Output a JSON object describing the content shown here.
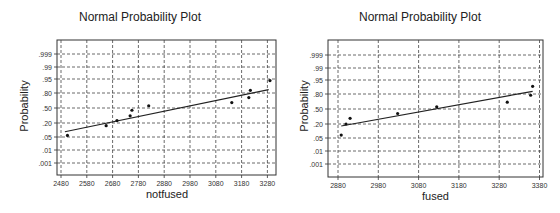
{
  "chart_data": [
    {
      "type": "scatter",
      "title": "Normal Probability Plot",
      "xlabel": "notfused",
      "ylabel": "Probability",
      "x_ticks": [
        2480,
        2580,
        2680,
        2780,
        2880,
        2980,
        3080,
        3180,
        3280
      ],
      "y_ticks": [
        ".001",
        ".01",
        ".05",
        ".20",
        ".50",
        ".80",
        ".95",
        ".99",
        ".999"
      ],
      "xlim": [
        2465,
        3310
      ],
      "grid": true,
      "points": [
        {
          "x": 2505,
          "p": 0.06
        },
        {
          "x": 2655,
          "p": 0.16
        },
        {
          "x": 2697,
          "p": 0.24
        },
        {
          "x": 2748,
          "p": 0.33
        },
        {
          "x": 2755,
          "p": 0.45
        },
        {
          "x": 2820,
          "p": 0.55
        },
        {
          "x": 3142,
          "p": 0.62
        },
        {
          "x": 3208,
          "p": 0.72
        },
        {
          "x": 3214,
          "p": 0.84
        },
        {
          "x": 3290,
          "p": 0.94
        }
      ],
      "fit_line": {
        "x0": 2495,
        "p0": 0.09,
        "x1": 3285,
        "p1": 0.85
      }
    },
    {
      "type": "scatter",
      "title": "Normal Probability Plot",
      "xlabel": "fused",
      "ylabel": "Probability",
      "x_ticks": [
        2880,
        2980,
        3080,
        3180,
        3280,
        3380
      ],
      "y_ticks": [
        ".001",
        ".01",
        ".05",
        ".20",
        ".50",
        ".80",
        ".95",
        ".99",
        ".999"
      ],
      "xlim": [
        2855,
        3390
      ],
      "grid": true,
      "points": [
        {
          "x": 2888,
          "p": 0.07
        },
        {
          "x": 2900,
          "p": 0.2
        },
        {
          "x": 2910,
          "p": 0.3
        },
        {
          "x": 3028,
          "p": 0.4
        },
        {
          "x": 3125,
          "p": 0.55
        },
        {
          "x": 3300,
          "p": 0.65
        },
        {
          "x": 3358,
          "p": 0.78
        },
        {
          "x": 3363,
          "p": 0.9
        }
      ],
      "fit_line": {
        "x0": 2888,
        "p0": 0.17,
        "x1": 3363,
        "p1": 0.84
      }
    }
  ],
  "colors": {
    "axis": "#333333",
    "grid": "#444444",
    "point": "#111111",
    "line": "#222222"
  }
}
